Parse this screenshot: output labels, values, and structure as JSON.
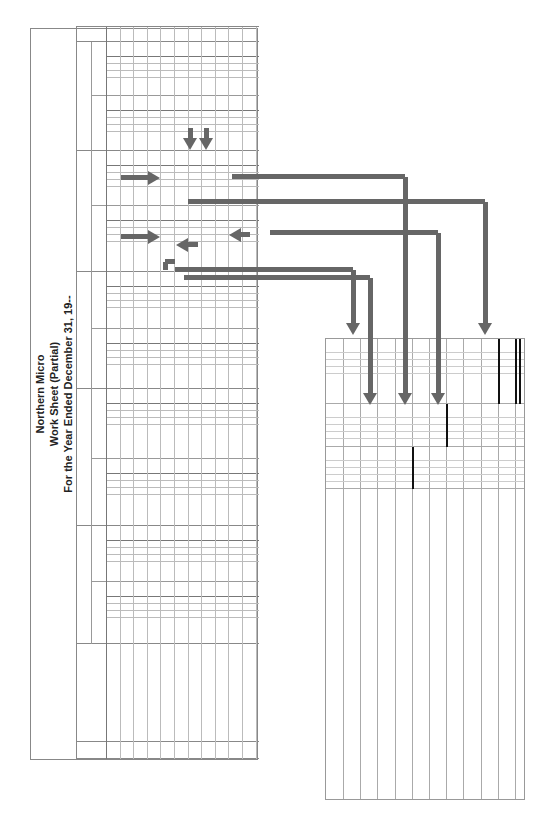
{
  "worksheet": {
    "company": "Northern Micro",
    "title": "Work Sheet (Partial)",
    "period": "For the Year Ended December 31, 19--",
    "headers": {
      "account_title": "ACCOUNT TITLE",
      "trial_balance": "TRIAL BALANCE",
      "adjustments": "ADJUSTMENTS",
      "adjusted_trial_balance_1": "ADJUSTED",
      "adjusted_trial_balance_2": "TRIAL BALANCE",
      "income_statement_1": "INCOME",
      "income_statement_2": "STATEMENT",
      "balance_sheet": "BALANCE SHEET",
      "debit": "DEBIT",
      "credit": "CREDIT"
    },
    "row_numbers": [
      "1",
      "2",
      "3",
      "4",
      "5",
      "6",
      "7",
      "8",
      "9",
      "10",
      "11"
    ],
    "rows": [
      {
        "n": "4",
        "account": "Merchandise Inv.",
        "tb_debit": "26 000 00",
        "adj_debit": "(2) 18 000 00",
        "adj_credit": "(1) 26 000 00",
        "atb_debit": "18 000 00",
        "bs_debit": "18 000 00"
      },
      {
        "n": "5",
        "account": "Income Summary",
        "bold": true,
        "adj_debit": "(1) 26 000 00",
        "adj_credit": "(2) 18 000 00",
        "atb_debit": "26 000 00",
        "atb_credit": "18 000 00",
        "is_debit": "26 000 00",
        "is_credit": "18 000 00"
      },
      {
        "n": "6",
        "account": "Purchases",
        "tb_debit": "105 000 00",
        "atb_debit": "105 000 00",
        "is_debit": "105 000 00"
      },
      {
        "n": "7",
        "account": "Purch. Ret. & Allow.",
        "tb_credit": "8 000 00",
        "atb_credit": "8 000 00",
        "is_credit": "8 000 00"
      },
      {
        "n": "8",
        "account": "Purchases Discount",
        "tb_credit": "1 000 00",
        "atb_credit": "1 000 00",
        "is_credit": "1 000 00"
      },
      {
        "n": "9",
        "account": "Freight-In",
        "tb_debit": "300 00",
        "atb_debit": "300 00",
        "is_debit": "300 00"
      }
    ],
    "annotations": {
      "begin_inv": "Begin. Inv.",
      "end_inv": "End. Inv.",
      "purchases": "Purchases",
      "freight_in": "Freight-In",
      "pur_r_a": "Pur. R & A",
      "pur_discounts": "Pur. Discounts"
    }
  },
  "cogs": {
    "title": "Cost of Goods Sold",
    "lines": [
      {
        "label": "Merchandise inventory, January 1",
        "light": true,
        "col3": "26 000 00"
      },
      {
        "label": "Purchases",
        "col2": "105 000 00"
      },
      {
        "label": "Less purchases returns and allowances",
        "indent": true,
        "col1": "8 000 00"
      },
      {
        "label": "Less purchases discounts",
        "indent": true,
        "col1": "1 000 00",
        "col2": "1 800 00"
      },
      {
        "label": "Net purchases",
        "col2": "103 200 00"
      },
      {
        "label": "Add freight-in",
        "col2": "300 00"
      },
      {
        "label": "Cost of merchandise purchased",
        "col3": "103 500 00"
      },
      {
        "label": "Merchandise available for sale",
        "col3": "129 500 00"
      },
      {
        "label": "Less merchandise inventory, Dec. 31",
        "light": true,
        "col3": "18 000 00"
      },
      {
        "label": "Cost of goods sold",
        "col3": "111 500 00"
      }
    ]
  },
  "colors": {
    "arrow": "#666666",
    "grid": "#999999",
    "light_text": "#888888"
  }
}
